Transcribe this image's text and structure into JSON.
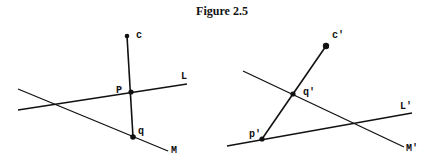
{
  "title": "Figure 2.5",
  "left_diagram": {
    "lines": [
      {
        "name": "L",
        "label": "L",
        "x1": 18,
        "y1": 110,
        "x2": 187,
        "y2": 84,
        "lx": 181,
        "ly": 79
      },
      {
        "name": "M",
        "label": "M",
        "x1": 18,
        "y1": 89,
        "x2": 168,
        "y2": 151,
        "lx": 171,
        "ly": 153
      }
    ],
    "segment": {
      "x1": 127,
      "y1": 36,
      "x2": 133,
      "y2": 137
    },
    "points": [
      {
        "name": "c",
        "label": "c",
        "x": 127,
        "y": 36,
        "r": 2.3,
        "lx": 136,
        "ly": 38
      },
      {
        "name": "p",
        "label": "P",
        "x": 131,
        "y": 92,
        "r": 2.6,
        "lx": 116,
        "ly": 93
      },
      {
        "name": "q",
        "label": "q",
        "x": 133,
        "y": 137,
        "r": 2.8,
        "lx": 138,
        "ly": 134
      }
    ]
  },
  "right_diagram": {
    "lines": [
      {
        "name": "L-prime",
        "label": "L'",
        "x1": 227,
        "y1": 146,
        "x2": 412,
        "y2": 113,
        "lx": 400,
        "ly": 109
      },
      {
        "name": "M-prime",
        "label": "M'",
        "x1": 243,
        "y1": 71,
        "x2": 404,
        "y2": 147,
        "lx": 406,
        "ly": 151
      }
    ],
    "segment": {
      "x1": 326,
      "y1": 46,
      "x2": 262,
      "y2": 139
    },
    "points": [
      {
        "name": "c-prime",
        "label": "c'",
        "x": 326,
        "y": 46,
        "r": 3.2,
        "lx": 332,
        "ly": 38
      },
      {
        "name": "q-prime",
        "label": "q'",
        "x": 293,
        "y": 94,
        "r": 2.6,
        "lx": 303,
        "ly": 95
      },
      {
        "name": "p-prime",
        "label": "p'",
        "x": 262,
        "y": 139,
        "r": 2.6,
        "lx": 249,
        "ly": 137
      }
    ]
  }
}
